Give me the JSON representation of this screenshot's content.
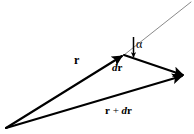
{
  "figure": {
    "background_color": "#ffffff",
    "stroke_color": "#000000",
    "tangent_color": "#7a7a7a"
  },
  "labels": {
    "r": "r",
    "dr_d": "d",
    "dr_r": "r",
    "sum_r": "r",
    "sum_plus": " + ",
    "sum_d": "d",
    "sum_r2": "r",
    "alpha": "α"
  },
  "geometry": {
    "origin": {
      "x": 6,
      "y": 128
    },
    "r_tip": {
      "x": 124,
      "y": 55
    },
    "sum_tip": {
      "x": 186,
      "y": 76
    },
    "tangent_end": {
      "x": 191,
      "y": 2
    },
    "angle_marker_x": 133,
    "angle_marker_top_y": 37,
    "angle_marker_bottom_y": 57
  },
  "label_positions": {
    "r": {
      "x": 74,
      "y": 54
    },
    "dr": {
      "x": 112,
      "y": 62
    },
    "alpha": {
      "x": 136,
      "y": 38
    },
    "sum": {
      "x": 105,
      "y": 105
    }
  }
}
